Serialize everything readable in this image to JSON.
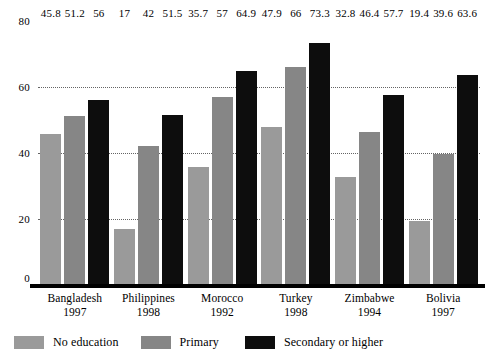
{
  "chart_data": {
    "type": "bar",
    "title": "",
    "subtitle": "",
    "xlabel": "",
    "ylabel": "",
    "ylim": [
      0,
      80
    ],
    "yticks": [
      0,
      20,
      40,
      60,
      80
    ],
    "ytick_labels": [
      "0",
      "20",
      "40",
      "60",
      "80"
    ],
    "grid": "dotted-horizontal",
    "legend_position": "bottom-left",
    "categories": [
      "Bangladesh",
      "Philippines",
      "Morocco",
      "Turkey",
      "Zimbabwe",
      "Bolivia"
    ],
    "category_years": [
      "1997",
      "1998",
      "1992",
      "1998",
      "1994",
      "1997"
    ],
    "series": [
      {
        "name": "No education",
        "color": "#9a9a9a",
        "values": [
          45.8,
          17,
          35.7,
          47.9,
          32.8,
          19.4
        ],
        "labels": [
          "45.8",
          "17",
          "35.7",
          "47.9",
          "32.8",
          "19.4"
        ]
      },
      {
        "name": "Primary",
        "color": "#868686",
        "values": [
          51.2,
          42,
          57,
          66,
          46.4,
          39.6
        ],
        "labels": [
          "51.2",
          "42",
          "57",
          "66",
          "46.4",
          "39.6"
        ]
      },
      {
        "name": "Secondary or higher",
        "color": "#0d0d0d",
        "values": [
          56,
          51.5,
          64.9,
          73.3,
          57.7,
          63.6
        ],
        "labels": [
          "56",
          "51.5",
          "64.9",
          "73.3",
          "57.7",
          "63.6"
        ]
      }
    ]
  },
  "colors": {
    "no_education": "#9a9a9a",
    "primary": "#868686",
    "secondary_or_higher": "#0d0d0d",
    "axis": "#000000",
    "gridline": "#4a4a4a",
    "background": "#ffffff"
  }
}
